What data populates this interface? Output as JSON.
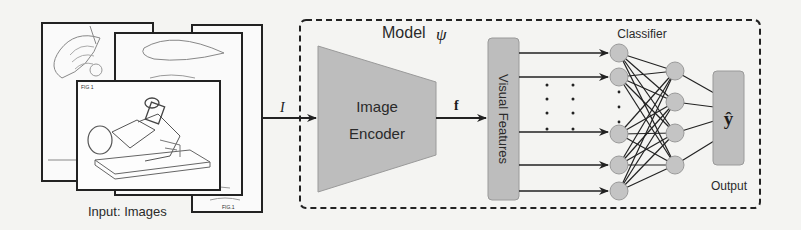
{
  "input": {
    "label": "Input: Images",
    "pages": [
      {
        "id": "back-left",
        "caption": ""
      },
      {
        "id": "back-right",
        "caption": "FIG.1"
      },
      {
        "id": "middle",
        "caption": "FIG.1"
      },
      {
        "id": "front",
        "caption": "FIG 1"
      }
    ],
    "arrow_label": "I"
  },
  "model": {
    "title": "Model",
    "title_symbol": "ψ",
    "encoder": {
      "line1": "Image",
      "line2": "Encoder"
    },
    "feature_arrow_label": "f",
    "features_label": "Visual Features",
    "classifier": {
      "label": "Classifier",
      "layer1_nodes": 5,
      "layer2_nodes": 4,
      "output_symbol": "ŷ",
      "output_label": "Output"
    }
  },
  "colors": {
    "background": "#f4f4f2",
    "block_fill": "#bdbdbd",
    "node_fill": "#c4c4c4",
    "stroke": "#222222"
  }
}
